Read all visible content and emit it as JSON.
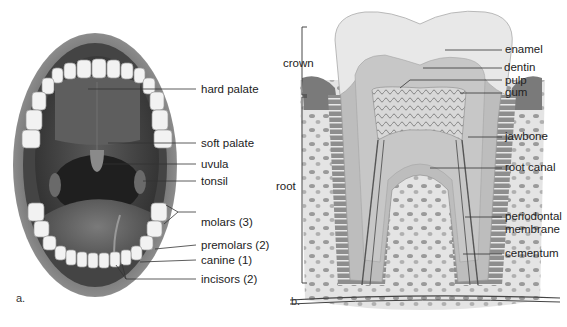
{
  "figure": {
    "panel_a": {
      "letter": "a.",
      "subject": "mouth-open-view",
      "labels": {
        "hard_palate": "hard palate",
        "soft_palate": "soft palate",
        "uvula": "uvula",
        "tonsil": "tonsil",
        "molars": "molars (3)",
        "premolars": "premolars (2)",
        "canine": "canine (1)",
        "incisors": "incisors (2)"
      }
    },
    "panel_b": {
      "letter": "b.",
      "subject": "tooth-cross-section",
      "brackets": {
        "crown": "crown",
        "root": "root"
      },
      "labels": {
        "enamel": "enamel",
        "dentin": "dentin",
        "pulp": "pulp",
        "gum": "gum",
        "jawbone": "jawbone",
        "root_canal": "root canal",
        "periodontal_1": "periodontal",
        "periodontal_2": "membrane",
        "cementum": "cementum"
      }
    }
  }
}
